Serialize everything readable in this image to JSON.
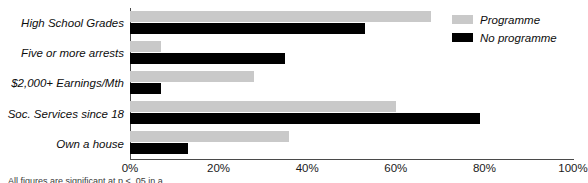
{
  "chart_data": {
    "type": "bar",
    "orientation": "horizontal",
    "title": "",
    "xlabel": "",
    "ylabel": "",
    "categories": [
      "High School Grades",
      "Five or more arrests",
      "$2,000+ Earnings/Mth",
      "Soc. Services since 18",
      "Own a house"
    ],
    "series": [
      {
        "name": "Programme",
        "color": "#c9c9c9",
        "values": [
          68,
          7,
          28,
          60,
          36
        ]
      },
      {
        "name": "No programme",
        "color": "#000000",
        "values": [
          53,
          35,
          7,
          79,
          13
        ]
      }
    ],
    "xlim": [
      0,
      100
    ],
    "xticks": [
      "0%",
      "20%",
      "40%",
      "60%",
      "80%",
      "100%"
    ],
    "xtick_values": [
      0,
      20,
      40,
      60,
      80,
      100
    ],
    "grid": false,
    "legend_position": "top-right"
  },
  "legend": {
    "items": [
      {
        "label": "Programme",
        "swatch": "programme"
      },
      {
        "label": "No programme",
        "swatch": "noprogramme"
      }
    ]
  },
  "caption": {
    "text": "All figures are significant at p < .05 in a ..."
  }
}
